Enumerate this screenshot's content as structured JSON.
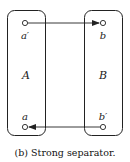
{
  "diagram": {
    "partitions": [
      {
        "id": "A",
        "label": "A"
      },
      {
        "id": "B",
        "label": "B"
      }
    ],
    "nodes": [
      {
        "id": "a_prime",
        "label": "a′",
        "partition": "A"
      },
      {
        "id": "b",
        "label": "b",
        "partition": "B"
      },
      {
        "id": "a",
        "label": "a",
        "partition": "A"
      },
      {
        "id": "b_prime",
        "label": "b′",
        "partition": "B"
      }
    ],
    "edges": [
      {
        "from": "a_prime",
        "to": "b",
        "directed": true
      },
      {
        "from": "b_prime",
        "to": "a",
        "directed": true
      }
    ],
    "caption": "(b) Strong separator.",
    "stroke_color": "#222222"
  }
}
